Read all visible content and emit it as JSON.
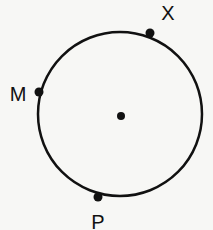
{
  "diagram": {
    "type": "circle-with-points",
    "circle": {
      "cx": 120,
      "cy": 114,
      "r": 82,
      "stroke": "#111111",
      "stroke_width": 2.5
    },
    "center_point": {
      "x": 121,
      "y": 116,
      "label": ""
    },
    "points": [
      {
        "id": "X",
        "label": "X",
        "x": 150,
        "y": 33,
        "label_x": 168,
        "label_y": 20
      },
      {
        "id": "M",
        "label": "M",
        "x": 39,
        "y": 92,
        "label_x": 18,
        "label_y": 101
      },
      {
        "id": "P",
        "label": "P",
        "x": 98,
        "y": 197,
        "label_x": 98,
        "label_y": 229
      }
    ],
    "colors": {
      "ink": "#111111",
      "background": "#f7f7f5"
    }
  }
}
